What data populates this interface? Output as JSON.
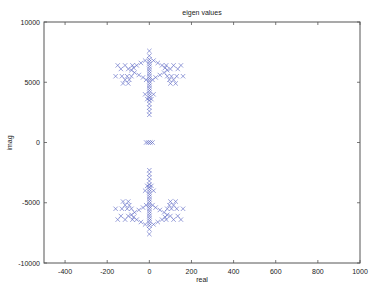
{
  "chart_data": {
    "type": "scatter",
    "title": "eigen values",
    "xlabel": "real",
    "ylabel": "imag",
    "xlim": [
      -500,
      1000
    ],
    "ylim": [
      -10000,
      10000
    ],
    "xticks": [
      -400,
      -200,
      0,
      200,
      400,
      600,
      800,
      1000
    ],
    "yticks": [
      -10000,
      -5000,
      0,
      5000,
      10000
    ],
    "grid": false,
    "legend": null,
    "marker": "x",
    "marker_color": "#5560c0",
    "series": [
      {
        "name": "eigenvalues",
        "points": [
          [
            0,
            7600
          ],
          [
            0,
            7200
          ],
          [
            0,
            6900
          ],
          [
            0,
            6700
          ],
          [
            0,
            6500
          ],
          [
            0,
            6300
          ],
          [
            0,
            6100
          ],
          [
            0,
            5900
          ],
          [
            0,
            5700
          ],
          [
            0,
            5500
          ],
          [
            0,
            5300
          ],
          [
            0,
            5100
          ],
          [
            0,
            4900
          ],
          [
            0,
            4700
          ],
          [
            0,
            4500
          ],
          [
            0,
            4300
          ],
          [
            0,
            4100
          ],
          [
            0,
            3900
          ],
          [
            0,
            3700
          ],
          [
            0,
            3500
          ],
          [
            0,
            3200
          ],
          [
            0,
            2900
          ],
          [
            0,
            2600
          ],
          [
            0,
            2300
          ],
          [
            -20,
            6800
          ],
          [
            20,
            6800
          ],
          [
            -40,
            6600
          ],
          [
            40,
            6600
          ],
          [
            -60,
            6400
          ],
          [
            60,
            6400
          ],
          [
            -75,
            6200
          ],
          [
            75,
            6200
          ],
          [
            -85,
            6000
          ],
          [
            85,
            6000
          ],
          [
            -70,
            5800
          ],
          [
            70,
            5800
          ],
          [
            -50,
            5600
          ],
          [
            50,
            5600
          ],
          [
            -30,
            5400
          ],
          [
            30,
            5400
          ],
          [
            -15,
            5200
          ],
          [
            15,
            5200
          ],
          [
            -150,
            6400
          ],
          [
            -115,
            6400
          ],
          [
            -80,
            6400
          ],
          [
            80,
            6400
          ],
          [
            115,
            6400
          ],
          [
            150,
            6400
          ],
          [
            -135,
            6100
          ],
          [
            -100,
            6100
          ],
          [
            100,
            6100
          ],
          [
            135,
            6100
          ],
          [
            -160,
            5500
          ],
          [
            -130,
            5500
          ],
          [
            -105,
            5500
          ],
          [
            -85,
            5500
          ],
          [
            85,
            5500
          ],
          [
            105,
            5500
          ],
          [
            130,
            5500
          ],
          [
            160,
            5500
          ],
          [
            -115,
            5200
          ],
          [
            -95,
            5200
          ],
          [
            95,
            5200
          ],
          [
            115,
            5200
          ],
          [
            -125,
            4900
          ],
          [
            -100,
            4900
          ],
          [
            100,
            4900
          ],
          [
            125,
            4900
          ],
          [
            -20,
            4000
          ],
          [
            20,
            4000
          ],
          [
            -10,
            3600
          ],
          [
            10,
            3600
          ],
          [
            -15,
            0
          ],
          [
            -5,
            0
          ],
          [
            5,
            0
          ],
          [
            15,
            0
          ],
          [
            0,
            -7600
          ],
          [
            0,
            -7200
          ],
          [
            0,
            -6900
          ],
          [
            0,
            -6700
          ],
          [
            0,
            -6500
          ],
          [
            0,
            -6300
          ],
          [
            0,
            -6100
          ],
          [
            0,
            -5900
          ],
          [
            0,
            -5700
          ],
          [
            0,
            -5500
          ],
          [
            0,
            -5300
          ],
          [
            0,
            -5100
          ],
          [
            0,
            -4900
          ],
          [
            0,
            -4700
          ],
          [
            0,
            -4500
          ],
          [
            0,
            -4300
          ],
          [
            0,
            -4100
          ],
          [
            0,
            -3900
          ],
          [
            0,
            -3700
          ],
          [
            0,
            -3500
          ],
          [
            0,
            -3200
          ],
          [
            0,
            -2900
          ],
          [
            0,
            -2600
          ],
          [
            0,
            -2300
          ],
          [
            -20,
            -6800
          ],
          [
            20,
            -6800
          ],
          [
            -40,
            -6600
          ],
          [
            40,
            -6600
          ],
          [
            -60,
            -6400
          ],
          [
            60,
            -6400
          ],
          [
            -75,
            -6200
          ],
          [
            75,
            -6200
          ],
          [
            -85,
            -6000
          ],
          [
            85,
            -6000
          ],
          [
            -70,
            -5800
          ],
          [
            70,
            -5800
          ],
          [
            -50,
            -5600
          ],
          [
            50,
            -5600
          ],
          [
            -30,
            -5400
          ],
          [
            30,
            -5400
          ],
          [
            -15,
            -5200
          ],
          [
            15,
            -5200
          ],
          [
            -150,
            -6400
          ],
          [
            -115,
            -6400
          ],
          [
            -80,
            -6400
          ],
          [
            80,
            -6400
          ],
          [
            115,
            -6400
          ],
          [
            150,
            -6400
          ],
          [
            -135,
            -6100
          ],
          [
            -100,
            -6100
          ],
          [
            100,
            -6100
          ],
          [
            135,
            -6100
          ],
          [
            -160,
            -5500
          ],
          [
            -130,
            -5500
          ],
          [
            -105,
            -5500
          ],
          [
            -85,
            -5500
          ],
          [
            85,
            -5500
          ],
          [
            105,
            -5500
          ],
          [
            130,
            -5500
          ],
          [
            160,
            -5500
          ],
          [
            -115,
            -5200
          ],
          [
            -95,
            -5200
          ],
          [
            95,
            -5200
          ],
          [
            115,
            -5200
          ],
          [
            -125,
            -4900
          ],
          [
            -100,
            -4900
          ],
          [
            100,
            -4900
          ],
          [
            125,
            -4900
          ],
          [
            -20,
            -4000
          ],
          [
            20,
            -4000
          ],
          [
            -10,
            -3600
          ],
          [
            10,
            -3600
          ]
        ]
      }
    ]
  },
  "layout": {
    "plot_left": 44,
    "plot_right": 360,
    "plot_top": 22,
    "plot_bottom": 263
  }
}
